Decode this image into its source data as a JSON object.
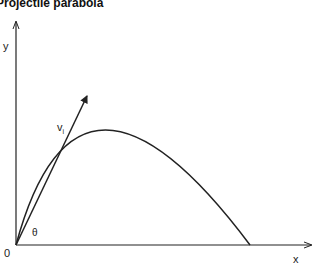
{
  "title": "Projectile parabola",
  "labels": {
    "y_axis": "y",
    "x_axis": "x",
    "origin": "0",
    "angle": "θ",
    "velocity": "v",
    "velocity_sub": "i"
  },
  "colors": {
    "stroke": "#222222",
    "background": "#ffffff"
  }
}
